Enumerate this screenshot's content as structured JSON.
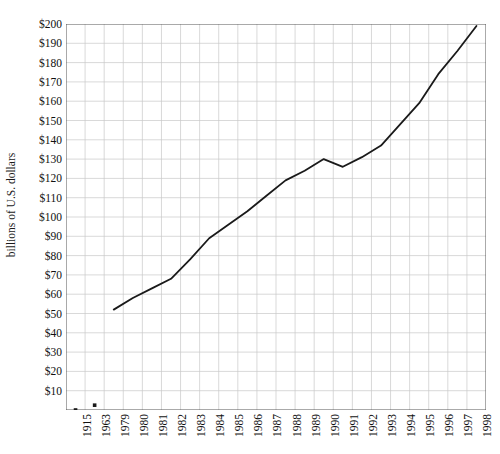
{
  "chart_data": {
    "type": "line",
    "title": "",
    "xlabel": "",
    "ylabel": "billions of U.S. dollars",
    "categories": [
      "1915",
      "1963",
      "1979",
      "1980",
      "1981",
      "1982",
      "1983",
      "1984",
      "1985",
      "1986",
      "1987",
      "1988",
      "1989",
      "1990",
      "1991",
      "1992",
      "1993",
      "1994",
      "1995",
      "1996",
      "1997",
      "1998"
    ],
    "values": [
      0,
      2.5,
      52,
      58,
      63,
      68,
      78,
      89,
      96,
      103,
      111,
      119,
      124,
      130,
      126,
      131,
      137,
      148,
      159,
      174,
      186,
      199
    ],
    "series": [
      {
        "name": "billions of U.S. dollars",
        "values": [
          0,
          2.5,
          52,
          58,
          63,
          68,
          78,
          89,
          96,
          103,
          111,
          119,
          124,
          130,
          126,
          131,
          137,
          148,
          159,
          174,
          186,
          199
        ]
      }
    ],
    "connected_from_index": 2,
    "isolated_points": [
      {
        "category": "1915",
        "value": 0
      },
      {
        "category": "1963",
        "value": 2.5
      }
    ],
    "ylim": [
      0,
      200
    ],
    "ytick_values": [
      10,
      20,
      30,
      40,
      50,
      60,
      70,
      80,
      90,
      100,
      110,
      120,
      130,
      140,
      150,
      160,
      170,
      180,
      190,
      200
    ],
    "ytick_labels": [
      "$10",
      "$20",
      "$30",
      "$40",
      "$50",
      "$60",
      "$70",
      "$80",
      "$90",
      "$100",
      "$110",
      "$120",
      "$130",
      "$140",
      "$150",
      "$160",
      "$170",
      "$180",
      "$190",
      "$200"
    ],
    "grid": true,
    "legend": "none",
    "line_color": "#1a1a1a",
    "grid_color": "#c8c8c8",
    "axis_color": "#555555",
    "background_color": "#ffffff"
  }
}
